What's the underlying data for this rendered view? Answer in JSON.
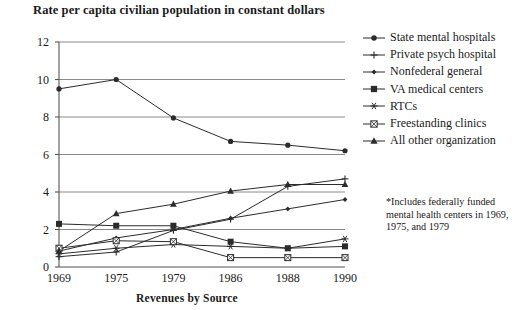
{
  "title": "Rate per capita civilian population in constant dollars",
  "footnote": "*Includes federally funded mental health centers in 1969, 1975, and 1979",
  "colors": {
    "ink": "#1a1a1a",
    "grid": "#8a8a8a",
    "axis": "#555555",
    "series": "#2b2b2b"
  },
  "chart_data": {
    "type": "line",
    "title": "Rate per capita civilian population in constant dollars",
    "xlabel": "Revenues by Source",
    "ylabel": "",
    "categories": [
      "1969",
      "1975",
      "1979",
      "1986",
      "1988",
      "1990"
    ],
    "ylim": [
      0,
      12
    ],
    "yticks": [
      0,
      2,
      4,
      6,
      8,
      10,
      12
    ],
    "grid": true,
    "legend_position": "right",
    "series": [
      {
        "name": "State mental hospitals",
        "marker": "filled-circle",
        "values": [
          9.5,
          10.0,
          7.95,
          6.7,
          6.5,
          6.2
        ]
      },
      {
        "name": "Private psych hospital",
        "marker": "plus",
        "values": [
          0.55,
          0.8,
          1.95,
          2.55,
          4.3,
          4.7
        ]
      },
      {
        "name": "Nonfederal general",
        "marker": "small-diamond",
        "values": [
          0.85,
          1.55,
          2.0,
          2.6,
          3.1,
          3.6
        ]
      },
      {
        "name": "VA medical centers",
        "marker": "filled-square",
        "values": [
          2.3,
          2.2,
          2.2,
          1.35,
          1.0,
          1.1
        ]
      },
      {
        "name": "RTCs",
        "marker": "asterisk",
        "values": [
          0.7,
          1.0,
          1.2,
          1.1,
          1.0,
          1.5
        ]
      },
      {
        "name": "Freestanding clinics",
        "marker": "open-square-cross",
        "values": [
          1.0,
          1.4,
          1.35,
          0.5,
          0.5,
          0.5
        ]
      },
      {
        "name": "All other organization",
        "marker": "filled-triangle",
        "values": [
          0.85,
          2.85,
          3.35,
          4.05,
          4.4,
          4.4
        ]
      }
    ]
  }
}
